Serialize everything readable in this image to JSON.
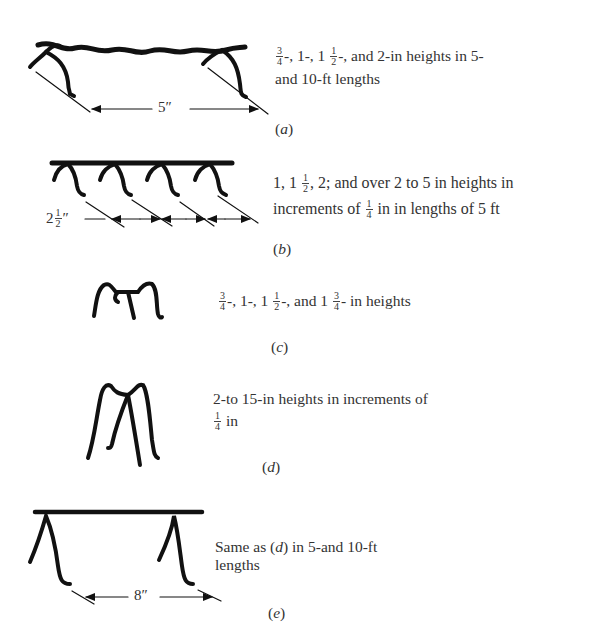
{
  "figure": {
    "panels": [
      {
        "id": "a",
        "caption": "a",
        "description_parts": [
          "3/4",
          "-, 1-, 1 ",
          "1/2",
          "-, and 2-in heights in 5-",
          "and 10-ft lengths"
        ],
        "description": "3/4-, 1-, 1 1/2-, and 2-in heights in 5- and 10-ft lengths",
        "dimension": "5″"
      },
      {
        "id": "b",
        "caption": "b",
        "description": "1, 1 1/2, 2; and over 2 to 5 in heights in increments of 1/4 in in lengths of 5 ft",
        "line1_a": "1, 1 ",
        "line1_b": ", 2; and over 2 to 5 in heights in",
        "line2_a": "increments of ",
        "line2_b": " in in lengths of 5 ft",
        "dimension_whole": "2",
        "dimension_unit": "″"
      },
      {
        "id": "c",
        "caption": "c",
        "description": "3/4-, 1-, 1 1/2-, and 1 3/4- in heights",
        "part1": "-, 1-, 1 ",
        "part2": "-, and 1 ",
        "part3": "- in heights"
      },
      {
        "id": "d",
        "caption": "d",
        "description": "2-to 15-in heights in increments of 1/4 in",
        "line1": "2-to 15-in heights in increments of",
        "line2_b": " in"
      },
      {
        "id": "e",
        "caption": "e",
        "description": "Same as (d) in 5-and 10-ft lengths",
        "line1_a": "Same as (",
        "line1_ref": "d",
        "line1_b": ") in 5-and 10-ft",
        "line2": "lengths",
        "dimension": "8″"
      }
    ],
    "fractions": {
      "three_quarters": {
        "num": "3",
        "den": "4"
      },
      "one_half": {
        "num": "1",
        "den": "2"
      },
      "one_quarter": {
        "num": "1",
        "den": "4"
      }
    }
  }
}
